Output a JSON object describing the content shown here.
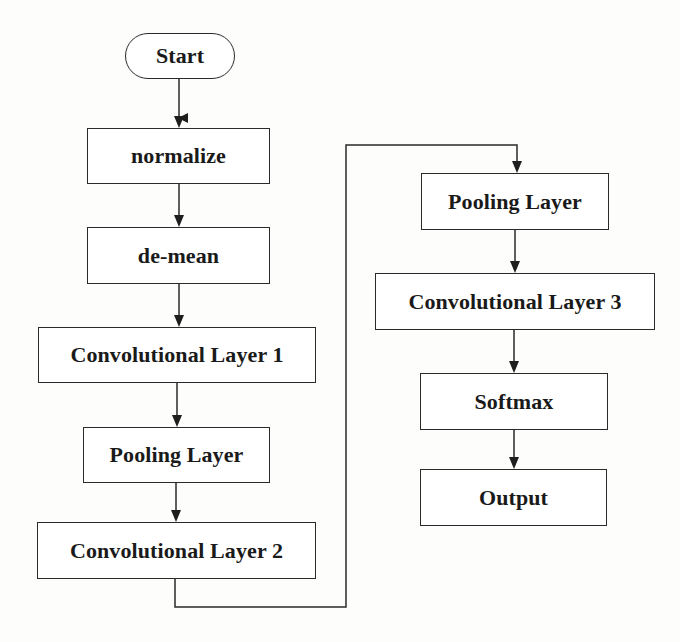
{
  "diagram": {
    "type": "flowchart",
    "colors": {
      "stroke": "#2a2a2a",
      "node_fill": "#ffffff",
      "background": "#fdfdfc",
      "text": "#1a1a1a"
    },
    "nodes": [
      {
        "id": "start",
        "shape": "terminal",
        "label": "Start"
      },
      {
        "id": "normalize",
        "shape": "process",
        "label": "normalize"
      },
      {
        "id": "de-mean",
        "shape": "process",
        "label": "de-mean"
      },
      {
        "id": "conv1",
        "shape": "process",
        "label": "Convolutional Layer 1"
      },
      {
        "id": "pool1",
        "shape": "process",
        "label": "Pooling Layer"
      },
      {
        "id": "conv2",
        "shape": "process",
        "label": "Convolutional Layer 2"
      },
      {
        "id": "pool2",
        "shape": "process",
        "label": "Pooling Layer"
      },
      {
        "id": "conv3",
        "shape": "process",
        "label": "Convolutional Layer 3"
      },
      {
        "id": "softmax",
        "shape": "process",
        "label": "Softmax"
      },
      {
        "id": "output",
        "shape": "process",
        "label": "Output"
      }
    ],
    "edges": [
      {
        "from": "start",
        "to": "normalize"
      },
      {
        "from": "normalize",
        "to": "de-mean"
      },
      {
        "from": "de-mean",
        "to": "conv1"
      },
      {
        "from": "conv1",
        "to": "pool1"
      },
      {
        "from": "pool1",
        "to": "conv2"
      },
      {
        "from": "conv2",
        "to": "pool2",
        "routing": "elbow"
      },
      {
        "from": "pool2",
        "to": "conv3"
      },
      {
        "from": "conv3",
        "to": "softmax"
      },
      {
        "from": "softmax",
        "to": "output"
      }
    ]
  }
}
